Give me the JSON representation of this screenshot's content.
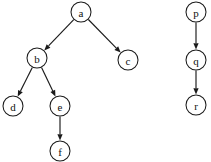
{
  "figure": {
    "background_color": "#ffffff",
    "stroke_color": "#1a1a1a",
    "node_fill_color": "#ffffff",
    "node_radius": 10,
    "width": 211,
    "height": 162
  },
  "graph_data": {
    "type": "directed-graph",
    "components": [
      {
        "name": "tree-a",
        "root": "a",
        "node_ids": [
          "a",
          "b",
          "c",
          "d",
          "e",
          "f"
        ]
      },
      {
        "name": "chain-p",
        "root": "p",
        "node_ids": [
          "p",
          "q",
          "r"
        ]
      }
    ],
    "nodes": [
      {
        "id": "a",
        "label": "a",
        "cx": 81,
        "cy": 12,
        "r": 10,
        "component": "tree-a"
      },
      {
        "id": "b",
        "label": "b",
        "cx": 37,
        "cy": 58,
        "r": 10,
        "component": "tree-a"
      },
      {
        "id": "c",
        "label": "c",
        "cx": 128,
        "cy": 60,
        "r": 10,
        "component": "tree-a"
      },
      {
        "id": "d",
        "label": "d",
        "cx": 13,
        "cy": 106,
        "r": 10,
        "component": "tree-a"
      },
      {
        "id": "e",
        "label": "e",
        "cx": 60,
        "cy": 106,
        "r": 10,
        "component": "tree-a"
      },
      {
        "id": "f",
        "label": "f",
        "cx": 60,
        "cy": 151,
        "r": 10,
        "component": "tree-a"
      },
      {
        "id": "p",
        "label": "p",
        "cx": 196,
        "cy": 12,
        "r": 10,
        "component": "chain-p"
      },
      {
        "id": "q",
        "label": "q",
        "cx": 196,
        "cy": 60,
        "r": 10,
        "component": "chain-p"
      },
      {
        "id": "r",
        "label": "r",
        "cx": 196,
        "cy": 105,
        "r": 10,
        "component": "chain-p"
      }
    ],
    "edges": [
      {
        "id": "a-b",
        "from": "a",
        "to": "b",
        "directed": true
      },
      {
        "id": "a-c",
        "from": "a",
        "to": "c",
        "directed": true
      },
      {
        "id": "b-d",
        "from": "b",
        "to": "d",
        "directed": true
      },
      {
        "id": "b-e",
        "from": "b",
        "to": "e",
        "directed": true
      },
      {
        "id": "e-f",
        "from": "e",
        "to": "f",
        "directed": true
      },
      {
        "id": "p-q",
        "from": "p",
        "to": "q",
        "directed": true
      },
      {
        "id": "q-r",
        "from": "q",
        "to": "r",
        "directed": true
      }
    ]
  }
}
